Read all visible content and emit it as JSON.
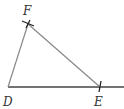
{
  "diagram": {
    "type": "geometry-construction",
    "colors": {
      "line": "#888888",
      "base": "#444444",
      "mark": "#222222",
      "label": "#333333"
    },
    "points": {
      "D": {
        "label": "D",
        "x": 8,
        "y": 87
      },
      "E": {
        "label": "E",
        "x": 100,
        "y": 87
      },
      "F": {
        "label": "F",
        "x": 28,
        "y": 24
      }
    },
    "segments": [
      {
        "from": "D",
        "to": "F"
      },
      {
        "from": "F",
        "to": "E"
      },
      {
        "from": "D",
        "to": "ray-end",
        "note": "baseline ray through E"
      }
    ],
    "labels": {
      "F": "F",
      "D": "D",
      "E": "E"
    }
  }
}
